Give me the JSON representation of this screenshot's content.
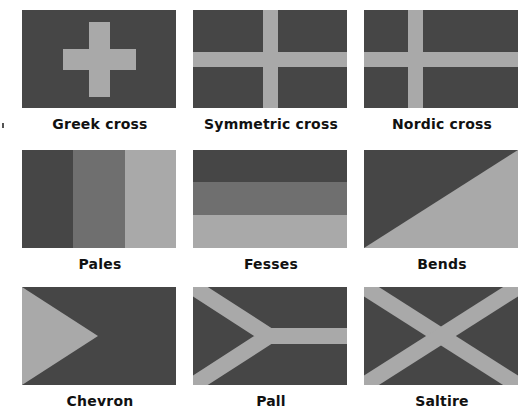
{
  "colors": {
    "dark": "#464646",
    "mid": "#6f6f6f",
    "light": "#a9a9a9"
  },
  "flags": [
    {
      "id": "greek-cross",
      "label": "Greek cross"
    },
    {
      "id": "symmetric-cross",
      "label": "Symmetric cross"
    },
    {
      "id": "nordic-cross",
      "label": "Nordic cross"
    },
    {
      "id": "pales",
      "label": "Pales"
    },
    {
      "id": "fesses",
      "label": "Fesses"
    },
    {
      "id": "bends",
      "label": "Bends"
    },
    {
      "id": "chevron",
      "label": "Chevron"
    },
    {
      "id": "pall",
      "label": "Pall"
    },
    {
      "id": "saltire",
      "label": "Saltire"
    }
  ]
}
